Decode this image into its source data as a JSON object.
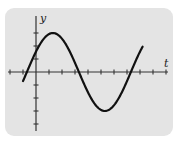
{
  "chart_data": {
    "type": "line",
    "title": "",
    "xlabel": "t",
    "ylabel": "y",
    "grid": false,
    "legend": null,
    "tick_labels": false,
    "x_ticks_units": [
      -2,
      -1,
      0,
      1,
      2,
      3,
      4,
      5,
      6,
      7,
      8,
      9,
      10
    ],
    "y_ticks_units": [
      -4,
      -3,
      -2,
      -1,
      0,
      1,
      2,
      3
    ],
    "xlim": [
      -2.2,
      10.2
    ],
    "ylim": [
      -4.4,
      4.2
    ],
    "series": [
      {
        "name": "y(t)",
        "function": "sine",
        "amplitude": 3,
        "period": 8,
        "phase_zero_crossing_t": -0.7,
        "x": [
          -1.0,
          -0.7,
          0,
          1.3,
          2.0,
          3.3,
          4.0,
          5.3,
          6.0,
          7.3,
          8.2
        ],
        "values": [
          -0.5,
          0,
          1.5,
          3,
          2.7,
          0,
          -1.5,
          -3,
          -2.7,
          0,
          2.0
        ]
      }
    ],
    "colors": {
      "panel": "#e4e4e4",
      "line": "#111111",
      "axes": "#333333"
    }
  },
  "labels": {
    "x_axis": "t",
    "y_axis": "y"
  }
}
